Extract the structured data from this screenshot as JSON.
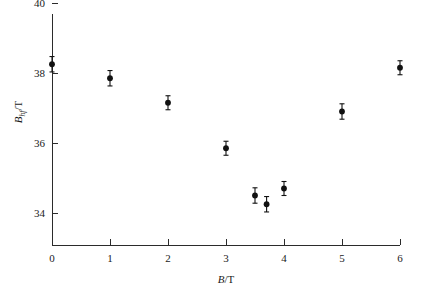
{
  "chart_data": {
    "type": "scatter",
    "title": "",
    "subtitle": "",
    "xlabel": "B/T",
    "ylabel": "Bhf/T",
    "xlabel_parts": {
      "symbol": "B",
      "separator": "/",
      "unit": "T"
    },
    "ylabel_parts": {
      "symbol": "B",
      "subscript": "hf",
      "separator": "/",
      "unit": "T"
    },
    "xlim": [
      0,
      6
    ],
    "ylim": [
      32.8,
      40
    ],
    "xticks": [
      0,
      1,
      2,
      3,
      4,
      5,
      6
    ],
    "xticklabels": [
      "0",
      "1",
      "2",
      "3",
      "4",
      "5",
      "6"
    ],
    "yticks": [
      34,
      36,
      38,
      40
    ],
    "yticklabels": [
      "34",
      "36",
      "38",
      "40"
    ],
    "grid": false,
    "legend": null,
    "legend_position": "none",
    "marker": "filled-circle",
    "marker_color": "#111111",
    "errorbar_color": "#111111",
    "axis_color": "#2b2b2b",
    "background_color": "#ffffff",
    "x": [
      0.0,
      1.0,
      2.0,
      3.0,
      3.5,
      3.7,
      4.0,
      5.0,
      6.0
    ],
    "y": [
      38.25,
      37.85,
      37.15,
      35.85,
      34.5,
      34.25,
      34.7,
      36.9,
      38.15
    ],
    "yerr": [
      0.22,
      0.22,
      0.2,
      0.2,
      0.22,
      0.22,
      0.2,
      0.22,
      0.2
    ],
    "points": [
      {
        "x": 0.0,
        "y": 38.25,
        "yerr": 0.22
      },
      {
        "x": 1.0,
        "y": 37.85,
        "yerr": 0.22
      },
      {
        "x": 2.0,
        "y": 37.15,
        "yerr": 0.2
      },
      {
        "x": 3.0,
        "y": 35.85,
        "yerr": 0.2
      },
      {
        "x": 3.5,
        "y": 34.5,
        "yerr": 0.22
      },
      {
        "x": 3.7,
        "y": 34.25,
        "yerr": 0.22
      },
      {
        "x": 4.0,
        "y": 34.7,
        "yerr": 0.2
      },
      {
        "x": 5.0,
        "y": 36.9,
        "yerr": 0.22
      },
      {
        "x": 6.0,
        "y": 38.15,
        "yerr": 0.2
      }
    ]
  }
}
